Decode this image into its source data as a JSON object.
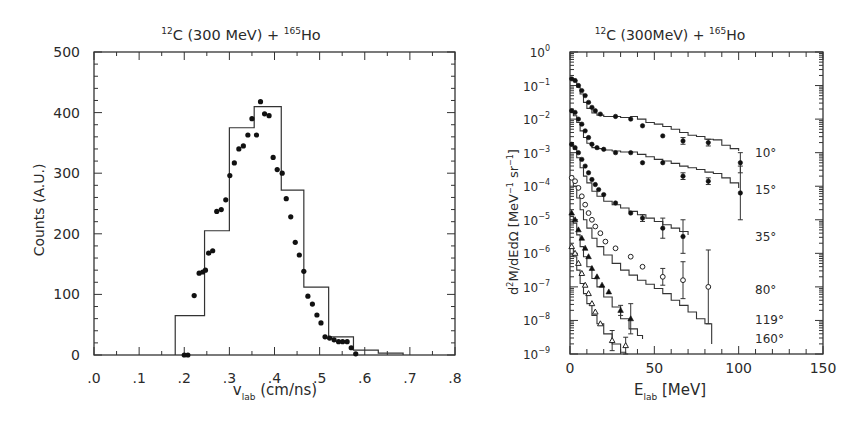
{
  "chart_data": [
    {
      "type": "bar",
      "subtype": "histogram_with_scatter",
      "title": "12C (300 MeV) + 165Ho",
      "title_parts": {
        "sup1": "12",
        "base1": "C (300 MeV) + ",
        "sup2": "165",
        "base2": "Ho"
      },
      "xlabel": "v_lab (cm/ns)",
      "xlabel_parts": {
        "base": "v",
        "sub": "lab",
        "unit": "(cm/ns)"
      },
      "ylabel": "Counts (A.U.)",
      "xlim": [
        0.0,
        0.8
      ],
      "ylim": [
        0,
        500
      ],
      "xticks": [
        ".0",
        ".1",
        ".2",
        ".3",
        ".4",
        ".5",
        ".6",
        ".7",
        ".8"
      ],
      "yticks": [
        "0",
        "100",
        "200",
        "300",
        "400",
        "500"
      ],
      "grid": false,
      "legend": null,
      "histogram": {
        "name": "calculation",
        "bin_edges": [
          0.18,
          0.245,
          0.3,
          0.355,
          0.415,
          0.465,
          0.52,
          0.575,
          0.63,
          0.685
        ],
        "values": [
          65,
          205,
          375,
          410,
          272,
          112,
          30,
          8,
          3
        ]
      },
      "points": {
        "name": "data",
        "x": [
          0.2,
          0.208,
          0.222,
          0.233,
          0.241,
          0.247,
          0.254,
          0.263,
          0.272,
          0.282,
          0.292,
          0.301,
          0.311,
          0.321,
          0.331,
          0.341,
          0.35,
          0.36,
          0.369,
          0.378,
          0.388,
          0.397,
          0.406,
          0.417,
          0.426,
          0.436,
          0.446,
          0.455,
          0.465,
          0.474,
          0.484,
          0.494,
          0.503,
          0.512,
          0.522,
          0.532,
          0.542,
          0.551,
          0.561,
          0.57,
          0.58
        ],
        "y": [
          0,
          0,
          98,
          135,
          137,
          140,
          168,
          172,
          237,
          240,
          256,
          296,
          317,
          340,
          345,
          363,
          390,
          363,
          418,
          398,
          395,
          326,
          306,
          300,
          258,
          228,
          186,
          165,
          138,
          97,
          84,
          66,
          53,
          30,
          28,
          25,
          22,
          22,
          22,
          12,
          2
        ]
      }
    },
    {
      "type": "line",
      "subtype": "log_spectra_with_points",
      "title": "12C (300MeV) + 165Ho",
      "title_parts": {
        "sup1": "12",
        "base1": "C (300MeV) + ",
        "sup2": "165",
        "base2": "Ho"
      },
      "xlabel": "E_lab [MeV]",
      "xlabel_parts": {
        "base": "E",
        "sub": "lab",
        "unit": "[MeV]"
      },
      "ylabel": "d2M/dEdΩ [MeV^-1 sr^-1]",
      "ylabel_parts": {
        "pre": "d",
        "sup": "2",
        "post": "M/dEdΩ  [MeV",
        "sup2": "−1",
        "post2": " sr",
        "sup3": "−1",
        "end": "]"
      },
      "xlim": [
        0,
        150
      ],
      "ylim_log10": [
        -9,
        0
      ],
      "xticks": [
        "0",
        "50",
        "100",
        "150"
      ],
      "yticks": [
        {
          "base": "10",
          "exp": "0"
        },
        {
          "base": "10",
          "exp": "−1"
        },
        {
          "base": "10",
          "exp": "−2"
        },
        {
          "base": "10",
          "exp": "−3"
        },
        {
          "base": "10",
          "exp": "−4"
        },
        {
          "base": "10",
          "exp": "−5"
        },
        {
          "base": "10",
          "exp": "−6"
        },
        {
          "base": "10",
          "exp": "−7"
        },
        {
          "base": "10",
          "exp": "−8"
        },
        {
          "base": "10",
          "exp": "−9"
        }
      ],
      "grid": false,
      "series": [
        {
          "name": "10°",
          "label": "10°",
          "label_log10": -3.0,
          "marker": "filled-circle",
          "curve_x": [
            0,
            2,
            4,
            6,
            8,
            10,
            13,
            16,
            20,
            25,
            30,
            36,
            40,
            45,
            50,
            55,
            60,
            65,
            70,
            75,
            80,
            85,
            90,
            95,
            100
          ],
          "curve_log10": [
            -0.8,
            -0.85,
            -1.05,
            -1.25,
            -1.5,
            -1.68,
            -1.82,
            -1.88,
            -1.92,
            -1.92,
            -1.95,
            -1.92,
            -2.0,
            -2.1,
            -2.15,
            -2.22,
            -2.3,
            -2.4,
            -2.48,
            -2.52,
            -2.6,
            -2.62,
            -2.78,
            -2.88,
            -2.95
          ],
          "points_x": [
            1,
            3,
            5,
            7,
            9,
            11,
            13,
            15,
            18,
            27,
            36,
            43,
            55,
            67,
            82,
            101
          ],
          "points_log10": [
            -0.8,
            -0.85,
            -1.0,
            -1.15,
            -1.3,
            -1.5,
            -1.65,
            -1.75,
            -1.85,
            -1.92,
            -2.0,
            -2.2,
            -2.5,
            -2.65,
            -2.7,
            -3.3
          ],
          "err_log10": [
            0,
            0,
            0,
            0,
            0,
            0,
            0,
            0,
            0,
            0,
            0,
            0,
            0,
            0.1,
            0.1,
            0.3
          ]
        },
        {
          "name": "15°",
          "label": "15°",
          "label_log10": -4.1,
          "marker": "filled-circle",
          "curve_x": [
            0,
            2,
            4,
            6,
            8,
            10,
            13,
            16,
            20,
            25,
            30,
            36,
            40,
            45,
            50,
            55,
            60,
            65,
            70,
            75,
            80,
            85,
            90,
            95,
            100
          ],
          "curve_log10": [
            -1.8,
            -1.9,
            -2.1,
            -2.35,
            -2.55,
            -2.72,
            -2.85,
            -2.88,
            -2.92,
            -2.95,
            -2.98,
            -2.98,
            -3.05,
            -3.12,
            -3.2,
            -3.25,
            -3.32,
            -3.4,
            -3.45,
            -3.5,
            -3.58,
            -3.62,
            -3.75,
            -3.9,
            -4.05
          ],
          "points_x": [
            1,
            3,
            5,
            7,
            9,
            11,
            13,
            16,
            20,
            27,
            36,
            43,
            55,
            67,
            82,
            101
          ],
          "points_log10": [
            -1.75,
            -1.8,
            -2.0,
            -2.15,
            -2.35,
            -2.55,
            -2.75,
            -2.85,
            -2.9,
            -3.0,
            -3.0,
            -3.3,
            -3.3,
            -3.7,
            -3.85,
            -4.2
          ],
          "err_log10": [
            0,
            0,
            0,
            0,
            0,
            0,
            0,
            0,
            0,
            0,
            0,
            0,
            0,
            0.1,
            0.1,
            0.8
          ]
        },
        {
          "name": "35°",
          "label": "35°",
          "label_log10": -5.5,
          "marker": "filled-circle",
          "curve_x": [
            0,
            2,
            4,
            6,
            8,
            10,
            13,
            16,
            20,
            25,
            30,
            35,
            40,
            45,
            50,
            55,
            60,
            65,
            70
          ],
          "curve_log10": [
            -2.8,
            -2.9,
            -3.15,
            -3.45,
            -3.7,
            -3.9,
            -4.15,
            -4.3,
            -4.45,
            -4.55,
            -4.65,
            -4.75,
            -4.85,
            -4.95,
            -5.05,
            -5.15,
            -5.25,
            -5.35,
            -5.45
          ],
          "points_x": [
            1,
            3,
            5,
            7,
            9,
            11,
            13,
            15,
            17,
            20,
            27,
            36,
            43,
            55,
            67
          ],
          "points_log10": [
            -2.75,
            -2.85,
            -3.0,
            -3.2,
            -3.4,
            -3.6,
            -3.8,
            -3.95,
            -4.1,
            -4.25,
            -4.5,
            -4.8,
            -4.95,
            -5.25,
            -5.5
          ],
          "err_log10": [
            0,
            0,
            0,
            0,
            0,
            0,
            0,
            0,
            0,
            0,
            0,
            0,
            0.1,
            0.3,
            0.5
          ]
        },
        {
          "name": "80°",
          "label": "80°",
          "label_log10": -7.1,
          "marker": "open-circle",
          "curve_x": [
            0,
            2,
            4,
            6,
            8,
            10,
            13,
            16,
            20,
            25,
            30,
            35,
            40,
            45,
            50,
            55,
            60,
            65,
            70,
            75,
            80,
            84
          ],
          "curve_log10": [
            -3.8,
            -4.0,
            -4.35,
            -4.7,
            -5.0,
            -5.25,
            -5.55,
            -5.8,
            -6.05,
            -6.3,
            -6.5,
            -6.65,
            -6.8,
            -6.92,
            -7.05,
            -7.2,
            -7.4,
            -7.55,
            -7.75,
            -7.95,
            -8.1,
            -8.7
          ],
          "points_x": [
            1,
            3,
            5,
            7,
            9,
            11,
            13,
            15,
            18,
            21,
            27,
            36,
            43,
            55,
            67,
            82
          ],
          "points_log10": [
            -3.75,
            -3.85,
            -4.05,
            -4.3,
            -4.55,
            -4.8,
            -5.0,
            -5.2,
            -5.4,
            -5.65,
            -5.85,
            -6.1,
            -6.4,
            -6.7,
            -6.8,
            -7.0
          ],
          "err_log10": [
            0,
            0,
            0,
            0,
            0,
            0,
            0,
            0,
            0,
            0,
            0,
            0,
            0,
            0.25,
            0.55,
            1.1
          ]
        },
        {
          "name": "119°",
          "label": "119°",
          "label_log10": -8.0,
          "marker": "filled-triangle",
          "curve_x": [
            0,
            2,
            4,
            6,
            8,
            10,
            13,
            16,
            20,
            25,
            30,
            35,
            40,
            43
          ],
          "curve_log10": [
            -4.9,
            -5.1,
            -5.45,
            -5.8,
            -6.1,
            -6.4,
            -6.75,
            -7.0,
            -7.3,
            -7.6,
            -7.95,
            -8.25,
            -8.45,
            -8.55
          ],
          "points_x": [
            1,
            3,
            5,
            7,
            9,
            11,
            13,
            16,
            19,
            23,
            30,
            36
          ],
          "points_log10": [
            -4.8,
            -5.0,
            -5.3,
            -5.55,
            -5.85,
            -6.1,
            -6.45,
            -6.7,
            -6.95,
            -7.15,
            -7.7,
            -7.95
          ],
          "err_log10": [
            0,
            0,
            0,
            0,
            0,
            0,
            0,
            0,
            0,
            0,
            0.15,
            0.45
          ]
        },
        {
          "name": "160°",
          "label": "160°",
          "label_log10": -8.55,
          "marker": "open-triangle",
          "curve_x": [
            0,
            2,
            4,
            6,
            8,
            10,
            13,
            16,
            20,
            25,
            30,
            33
          ],
          "curve_log10": [
            -5.85,
            -6.1,
            -6.5,
            -6.9,
            -7.2,
            -7.5,
            -7.85,
            -8.1,
            -8.4,
            -8.7,
            -8.95,
            -9.0
          ],
          "points_x": [
            1,
            3,
            5,
            7,
            9,
            11,
            13,
            15,
            18,
            25,
            33
          ],
          "points_log10": [
            -5.8,
            -6.0,
            -6.3,
            -6.6,
            -6.95,
            -7.2,
            -7.5,
            -7.75,
            -8.1,
            -8.6,
            -8.75
          ],
          "err_log10": [
            0,
            0,
            0,
            0,
            0,
            0,
            0,
            0,
            0,
            0.3,
            0.25
          ]
        }
      ]
    }
  ]
}
